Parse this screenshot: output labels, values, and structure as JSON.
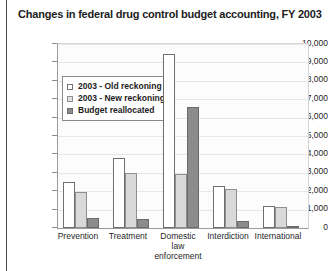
{
  "figure": {
    "title": "Changes in federal drug control budget accounting, FY 2003"
  },
  "legend": {
    "position": "inside-top-left",
    "items": [
      {
        "label": "2003 - Old reckoning",
        "swatch": "legend-swatch-old-reckoning",
        "color": "#ffffff"
      },
      {
        "label": "2003 - New reckoning",
        "swatch": "legend-swatch-new-reckoning",
        "color": "#d9d9d9"
      },
      {
        "label": "Budget reallocated",
        "swatch": "legend-swatch-budget-reallocated",
        "color": "#8c8c8c"
      }
    ]
  },
  "axis": {
    "y_ticks": [
      "10,000",
      "9,000",
      "8,000",
      "7,000",
      "6,000",
      "5,000",
      "4,000",
      "3,000",
      "2,000",
      "1,000",
      "0"
    ],
    "x_categories": [
      "Prevention",
      "Treatment",
      "Domestic\nlaw\nenforcement",
      "Interdiction",
      "International"
    ]
  },
  "chart_data": {
    "type": "bar",
    "title": "Changes in federal drug control budget accounting, FY 2003",
    "xlabel": "",
    "ylabel": "",
    "ylim": [
      0,
      10000
    ],
    "ytick_step": 1000,
    "grid": true,
    "legend_position": "inside-top-left",
    "categories": [
      "Prevention",
      "Treatment",
      "Domestic law enforcement",
      "Interdiction",
      "International"
    ],
    "series": [
      {
        "name": "2003 - Old reckoning",
        "color": "#ffffff",
        "values": [
          2500,
          3800,
          9450,
          2300,
          1200
        ]
      },
      {
        "name": "2003 - New reckoning",
        "color": "#d9d9d9",
        "values": [
          1950,
          3000,
          2950,
          2100,
          1150
        ]
      },
      {
        "name": "Budget reallocated",
        "color": "#8c8c8c",
        "values": [
          550,
          500,
          6600,
          400,
          100
        ]
      }
    ]
  }
}
